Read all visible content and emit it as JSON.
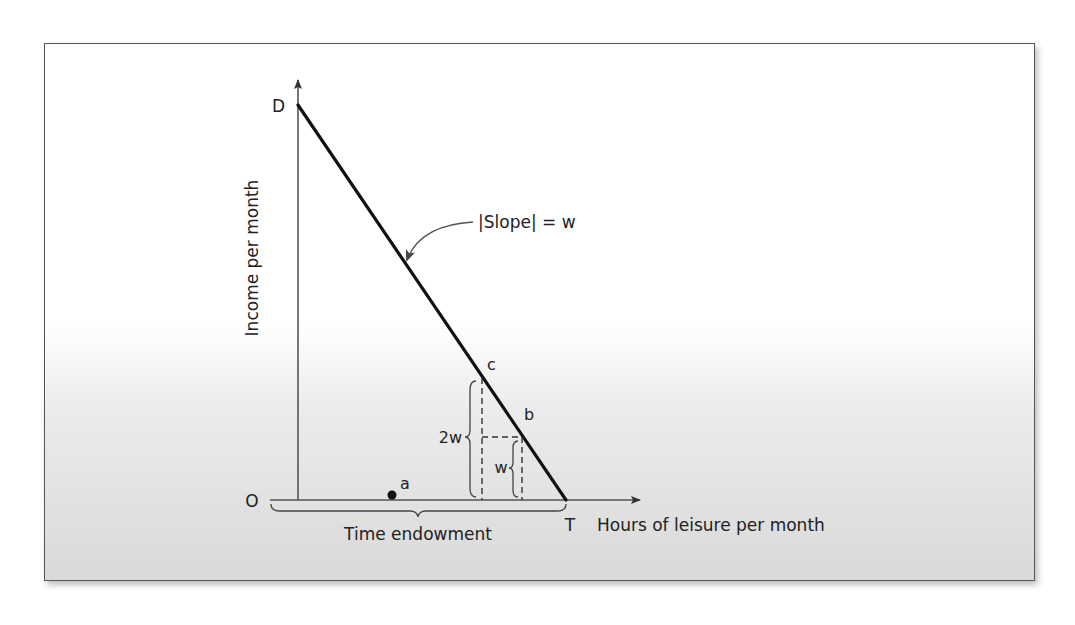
{
  "diagram": {
    "y_axis_label": "Income per month",
    "x_axis_label": "Hours of leisure per month",
    "origin_label": "O",
    "points": {
      "D": "D",
      "T": "T",
      "a": "a",
      "b": "b",
      "c": "c"
    },
    "slope_annotation": "|Slope| = w",
    "brace_2w": "2w",
    "brace_w": "w",
    "time_endowment_label": "Time endowment"
  }
}
